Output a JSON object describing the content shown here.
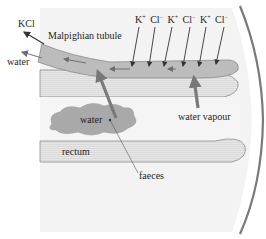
{
  "diagram": {
    "type": "biology-schematic",
    "labels": {
      "kcl": "KCl",
      "water_out": "water",
      "malpighian_tubule": "Malpighian tubule",
      "water_blob": "water",
      "rectum": "rectum",
      "water_vapour": "water vapour",
      "faeces": "faeces"
    },
    "ions": [
      {
        "symbol": "K",
        "charge": "+"
      },
      {
        "symbol": "Cl",
        "charge": "−"
      },
      {
        "symbol": "K",
        "charge": "+"
      },
      {
        "symbol": "Cl",
        "charge": "−"
      },
      {
        "symbol": "K",
        "charge": "+"
      },
      {
        "symbol": "Cl",
        "charge": "−"
      }
    ],
    "colors": {
      "background_panel": "#f2f2f2",
      "tubule_fill": "#b8b8b8",
      "tubule_stroke": "#8a8a8a",
      "gut_band": "#e4e4e4",
      "outline": "#7a7a7a",
      "arrow_dark": "#333333",
      "arrow_grey": "#7c7c7c",
      "text": "#1e1e1e"
    }
  }
}
